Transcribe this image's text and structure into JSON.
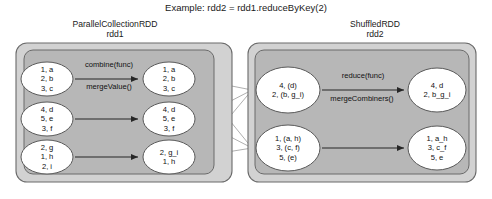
{
  "title": "Example: rdd2 = rdd1.reduceByKey(2)",
  "stages": {
    "left": {
      "name": "ParallelCollectionRDD",
      "variable": "rdd1"
    },
    "right": {
      "name": "ShuffledRDD",
      "variable": "rdd2"
    }
  },
  "colors": {
    "outer_container": "#d2d2d2",
    "inner_container": "#b5b5b5",
    "ellipse_fill": "#ffffff",
    "stroke": "#5a5a5a",
    "arrow": "#262626",
    "shuffle_line": "#b0b0b0",
    "text": "#1a1a1a",
    "page_background": "#ffffff"
  },
  "operations": {
    "left_top": "combine(func)",
    "left_bottom": "mergeValue()",
    "right_top": "reduce(func)",
    "right_bottom": "mergeCombiners()"
  },
  "partitions": {
    "input": [
      {
        "id": "in-1",
        "lines": [
          "1, a",
          "2, b",
          "3, c"
        ]
      },
      {
        "id": "in-2",
        "lines": [
          "4, d",
          "5, e",
          "3, f"
        ]
      },
      {
        "id": "in-3",
        "lines": [
          "2, g",
          "1, h",
          "2, i"
        ]
      }
    ],
    "combined": [
      {
        "id": "comb-1",
        "lines": [
          "1, a",
          "2, b",
          "3, c"
        ]
      },
      {
        "id": "comb-2",
        "lines": [
          "4, d",
          "5, e",
          "3, f"
        ]
      },
      {
        "id": "comb-3",
        "lines": [
          "2, g_i",
          "1, h"
        ]
      }
    ],
    "shuffled": [
      {
        "id": "shuf-1",
        "lines": [
          "4, (d)",
          "2, (b, g_i)"
        ]
      },
      {
        "id": "shuf-2",
        "lines": [
          "1, (a, h)",
          "3, (c, f)",
          "5, (e)"
        ]
      }
    ],
    "reduced": [
      {
        "id": "red-1",
        "lines": [
          "4, d",
          "2, b_g_i"
        ]
      },
      {
        "id": "red-2",
        "lines": [
          "1, a_h",
          "3, c_f",
          "5, e"
        ]
      }
    ]
  }
}
